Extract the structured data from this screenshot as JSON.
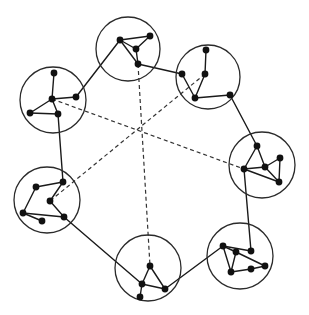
{
  "diagram": {
    "type": "clustered-graph",
    "colors": {
      "stroke": "#1a1a1a",
      "node": "#111111",
      "background": "#ffffff"
    },
    "clusters": [
      {
        "id": "c1",
        "circle": {
          "cx": 53,
          "cy": 100,
          "r": 33
        },
        "nodes": [
          [
            54,
            73
          ],
          [
            52,
            99
          ],
          [
            76,
            97
          ],
          [
            30,
            113
          ],
          [
            58,
            114
          ]
        ],
        "edges": [
          [
            0,
            1
          ],
          [
            1,
            2
          ],
          [
            1,
            3
          ],
          [
            1,
            4
          ],
          [
            3,
            4
          ]
        ]
      },
      {
        "id": "c2",
        "circle": {
          "cx": 128,
          "cy": 49,
          "r": 32
        },
        "nodes": [
          [
            120,
            40
          ],
          [
            150,
            36
          ],
          [
            136,
            49
          ],
          [
            138,
            64
          ]
        ],
        "edges": [
          [
            0,
            1
          ],
          [
            0,
            2
          ],
          [
            1,
            2
          ],
          [
            2,
            3
          ],
          [
            0,
            3
          ]
        ]
      },
      {
        "id": "c3",
        "circle": {
          "cx": 208,
          "cy": 77,
          "r": 32
        },
        "nodes": [
          [
            206,
            50
          ],
          [
            182,
            74
          ],
          [
            205,
            74
          ],
          [
            195,
            98
          ],
          [
            230,
            95
          ]
        ],
        "edges": [
          [
            0,
            2
          ],
          [
            1,
            3
          ],
          [
            2,
            3
          ],
          [
            3,
            4
          ]
        ]
      },
      {
        "id": "c4",
        "circle": {
          "cx": 262,
          "cy": 165,
          "r": 33
        },
        "nodes": [
          [
            257,
            146
          ],
          [
            280,
            158
          ],
          [
            265,
            167
          ],
          [
            244,
            169
          ],
          [
            279,
            182
          ]
        ],
        "edges": [
          [
            0,
            3
          ],
          [
            0,
            2
          ],
          [
            3,
            2
          ],
          [
            2,
            1
          ],
          [
            1,
            4
          ],
          [
            2,
            4
          ],
          [
            3,
            4
          ]
        ]
      },
      {
        "id": "c5",
        "circle": {
          "cx": 240,
          "cy": 256,
          "r": 33
        },
        "nodes": [
          [
            223,
            246
          ],
          [
            236,
            252
          ],
          [
            251,
            251
          ],
          [
            231,
            272
          ],
          [
            251,
            269
          ],
          [
            265,
            266
          ]
        ],
        "edges": [
          [
            0,
            2
          ],
          [
            0,
            1
          ],
          [
            0,
            3
          ],
          [
            1,
            3
          ],
          [
            1,
            5
          ],
          [
            3,
            4
          ],
          [
            4,
            5
          ]
        ]
      },
      {
        "id": "c6",
        "circle": {
          "cx": 148,
          "cy": 268,
          "r": 33
        },
        "nodes": [
          [
            150,
            266
          ],
          [
            142,
            284
          ],
          [
            165,
            289
          ],
          [
            140,
            297
          ]
        ],
        "edges": [
          [
            0,
            1
          ],
          [
            0,
            2
          ],
          [
            1,
            2
          ],
          [
            1,
            3
          ]
        ]
      },
      {
        "id": "c7",
        "circle": {
          "cx": 47,
          "cy": 200,
          "r": 33
        },
        "nodes": [
          [
            36,
            187
          ],
          [
            63,
            182
          ],
          [
            50,
            201
          ],
          [
            23,
            213
          ],
          [
            64,
            217
          ],
          [
            42,
            221
          ]
        ],
        "edges": [
          [
            0,
            1
          ],
          [
            0,
            3
          ],
          [
            1,
            2
          ],
          [
            2,
            4
          ],
          [
            3,
            4
          ],
          [
            3,
            5
          ]
        ]
      }
    ],
    "bridges": [
      [
        [
          76,
          97
        ],
        [
          120,
          40
        ]
      ],
      [
        [
          138,
          64
        ],
        [
          182,
          74
        ]
      ],
      [
        [
          230,
          95
        ],
        [
          257,
          146
        ]
      ],
      [
        [
          244,
          169
        ],
        [
          251,
          251
        ]
      ],
      [
        [
          223,
          246
        ],
        [
          165,
          289
        ]
      ],
      [
        [
          142,
          284
        ],
        [
          64,
          217
        ]
      ],
      [
        [
          63,
          182
        ],
        [
          58,
          114
        ]
      ]
    ],
    "dashed": [
      [
        [
          52,
          99
        ],
        [
          244,
          169
        ]
      ],
      [
        [
          138,
          64
        ],
        [
          150,
          266
        ]
      ],
      [
        [
          205,
          74
        ],
        [
          50,
          201
        ]
      ]
    ]
  }
}
